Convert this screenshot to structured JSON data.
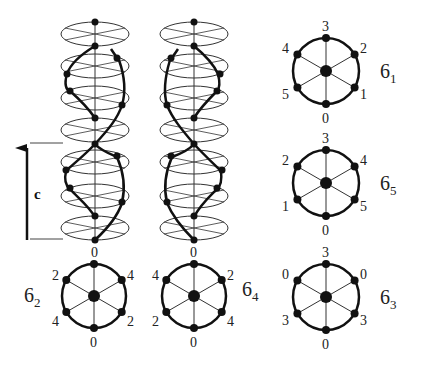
{
  "figure": {
    "axis_label": "c",
    "helices": [
      {
        "name": "left-helix",
        "bottom_label": "0"
      },
      {
        "name": "right-helix",
        "bottom_label": "0"
      }
    ],
    "projections": [
      {
        "id": "6_1",
        "symbol": "6",
        "subscript": "1",
        "labels": {
          "top": "3",
          "upper_right": "2",
          "lower_right": "1",
          "bottom": "0",
          "lower_left": "5",
          "upper_left": "4"
        }
      },
      {
        "id": "6_5",
        "symbol": "6",
        "subscript": "5",
        "labels": {
          "top": "3",
          "upper_right": "4",
          "lower_right": "5",
          "bottom": "0",
          "lower_left": "1",
          "upper_left": "2"
        }
      },
      {
        "id": "6_3",
        "symbol": "6",
        "subscript": "3",
        "labels": {
          "top": "3",
          "upper_right": "0",
          "lower_right": "3",
          "bottom": "0",
          "lower_left": "3",
          "upper_left": "0"
        }
      },
      {
        "id": "6_2",
        "symbol": "6",
        "subscript": "2",
        "labels": {
          "top": "0",
          "upper_right": "4",
          "lower_right": "2",
          "bottom": "0",
          "lower_left": "4",
          "upper_left": "2"
        }
      },
      {
        "id": "6_4",
        "symbol": "6",
        "subscript": "4",
        "labels": {
          "top": "0",
          "upper_right": "2",
          "lower_right": "4",
          "bottom": "0",
          "lower_left": "2",
          "upper_left": "4"
        }
      }
    ]
  }
}
